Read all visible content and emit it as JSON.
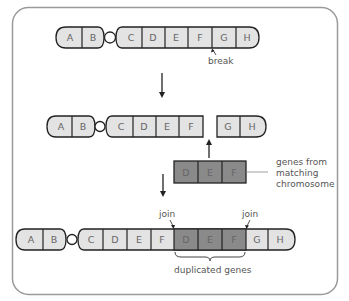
{
  "colors": {
    "frame": "#9a9a9a",
    "outline": "#222222",
    "light_fill": "#e3e3e3",
    "dark_fill": "#8a8a8a",
    "text": "#555555"
  },
  "row1": {
    "genes": [
      "A",
      "B",
      "C",
      "D",
      "E",
      "F",
      "G",
      "H"
    ],
    "break_label": "break"
  },
  "row2": {
    "left_genes": [
      "A",
      "B",
      "C",
      "D",
      "E",
      "F"
    ],
    "right_genes": [
      "G",
      "H"
    ]
  },
  "insert": {
    "genes": [
      "D",
      "E",
      "F"
    ],
    "label_lines": [
      "genes from",
      "matching",
      "chromosome"
    ]
  },
  "row3": {
    "genes": [
      "A",
      "B",
      "C",
      "D",
      "E",
      "F",
      "D",
      "E",
      "F",
      "G",
      "H"
    ],
    "join_left_label": "join",
    "join_right_label": "join",
    "brace_label": "duplicated genes"
  }
}
